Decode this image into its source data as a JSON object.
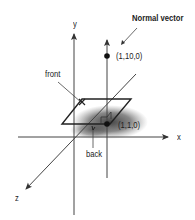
{
  "diagram": {
    "type": "3d-coordinate-plane-normal",
    "axes": {
      "x": {
        "label": "x"
      },
      "y": {
        "label": "y"
      },
      "z": {
        "label": "z"
      }
    },
    "normal_vector": {
      "label": "Normal vector",
      "tip_point": "(1,10,0)"
    },
    "plane": {
      "base_point": "(1,1,0)",
      "front_label": "front",
      "back_label": "back"
    },
    "colors": {
      "line": "#333333",
      "shadow": "#555555",
      "background": "#ffffff"
    }
  }
}
